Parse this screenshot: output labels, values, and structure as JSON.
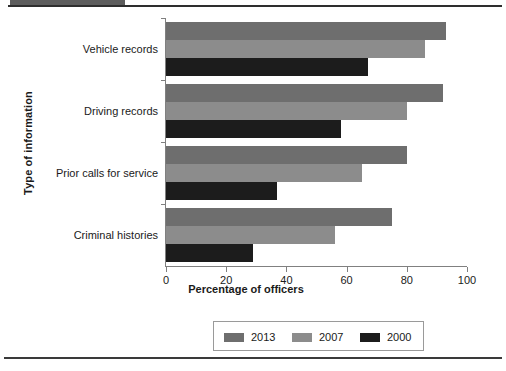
{
  "chart_data": {
    "type": "bar",
    "orientation": "horizontal",
    "title": "",
    "xlabel": "Percentage of officers",
    "ylabel": "Type of information",
    "categories": [
      "Vehicle records",
      "Driving records",
      "Prior calls for service",
      "Criminal histories"
    ],
    "series": [
      {
        "name": "2013",
        "color": "#6e6e6e",
        "values": [
          93,
          92,
          80,
          75
        ]
      },
      {
        "name": "2007",
        "color": "#8c8c8c",
        "values": [
          86,
          80,
          65,
          56
        ]
      },
      {
        "name": "2000",
        "color": "#1c1c1c",
        "values": [
          67,
          58,
          37,
          29
        ]
      }
    ],
    "xlim": [
      0,
      100
    ],
    "xticks": [
      0,
      20,
      40,
      60,
      80,
      100
    ],
    "xticklabels": [
      "0",
      "20",
      "40",
      "60",
      "80",
      "100"
    ],
    "grid": false,
    "legend_position": "bottom-center"
  },
  "legend": {
    "entries": [
      {
        "label": "2013",
        "color": "#6e6e6e"
      },
      {
        "label": "2007",
        "color": "#8c8c8c"
      },
      {
        "label": "2000",
        "color": "#1c1c1c"
      }
    ]
  },
  "page": {
    "top_bar_color": "#5d5d5d",
    "rule_color": "#2e2e2e"
  }
}
